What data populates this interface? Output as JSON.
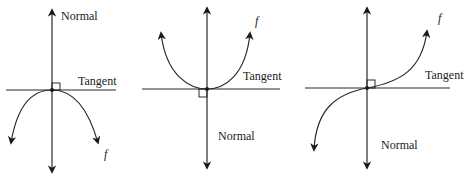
{
  "diagram": {
    "panels": [
      {
        "id": "concave-down",
        "curve_label": "f",
        "tangent_label": "Tangent",
        "normal_label": "Normal",
        "normal_label_position": "top"
      },
      {
        "id": "concave-up",
        "curve_label": "f",
        "tangent_label": "Tangent",
        "normal_label": "Normal",
        "normal_label_position": "bottom"
      },
      {
        "id": "inflection",
        "curve_label": "f",
        "tangent_label": "Tangent",
        "normal_label": "Normal",
        "normal_label_position": "bottom"
      }
    ],
    "colors": {
      "line": "#2a2a2a",
      "background": "#ffffff"
    }
  }
}
